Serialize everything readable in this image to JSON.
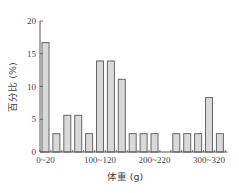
{
  "chart_data": {
    "type": "bar",
    "title": "",
    "xlabel": "体重 (g)",
    "ylabel": "百分比 (%)",
    "ylim": [
      0,
      20
    ],
    "yticks": [
      0,
      5,
      10,
      15,
      20
    ],
    "grid": false,
    "legend": null,
    "categories": [
      "0~20",
      "20~40",
      "40~60",
      "60~80",
      "80~100",
      "100~120",
      "120~140",
      "140~160",
      "160~180",
      "180~200",
      "200~220",
      "220~240",
      "240~260",
      "260~280",
      "280~300",
      "300~320",
      "320~340"
    ],
    "values": [
      16.7,
      2.8,
      5.6,
      5.6,
      2.8,
      13.9,
      13.9,
      11.1,
      2.8,
      2.8,
      2.8,
      0,
      2.8,
      2.8,
      2.8,
      8.3,
      2.8
    ],
    "xtick_labels": [
      {
        "index": 0,
        "label": "0~20"
      },
      {
        "index": 5,
        "label": "100~120"
      },
      {
        "index": 10,
        "label": "200~220"
      },
      {
        "index": 15,
        "label": "300~320"
      }
    ],
    "colors": {
      "bar_fill": "#d9d9d9",
      "bar_stroke": "#666666",
      "axis": "#555555"
    }
  }
}
